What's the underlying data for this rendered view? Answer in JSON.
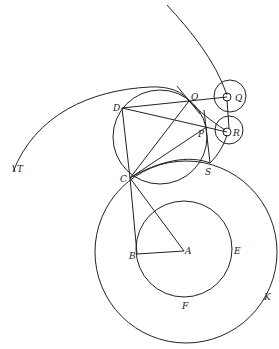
{
  "diagram": {
    "title": "",
    "labels": {
      "T": "T",
      "D": "D",
      "O": "O",
      "Q": "Q",
      "R": "R",
      "P": "P",
      "S": "S",
      "C": "C",
      "B": "B",
      "A": "A",
      "E": "E",
      "F": "F",
      "K": "K"
    },
    "points": {
      "A": [
        184,
        251
      ],
      "B": [
        137,
        254
      ],
      "C": [
        130,
        178
      ],
      "D": [
        122,
        108
      ],
      "O": [
        189,
        101
      ],
      "P": [
        205,
        128
      ],
      "S": [
        210,
        163
      ],
      "Q": [
        227,
        97
      ],
      "R": [
        227,
        132
      ]
    },
    "circles": [
      {
        "name": "outer-circle-K",
        "center": [
          186,
          252
        ],
        "r": 91
      },
      {
        "name": "inner-circle-EF",
        "center": [
          184,
          249
        ],
        "r": 48
      },
      {
        "name": "circle-DOPC",
        "center": [
          160,
          137
        ],
        "r": 47
      },
      {
        "name": "circle-Q-outer",
        "center": [
          230,
          96
        ],
        "r": 16
      },
      {
        "name": "circle-Q-inner",
        "center": [
          227,
          97
        ],
        "r": 4
      },
      {
        "name": "circle-R-outer",
        "center": [
          229,
          130
        ],
        "r": 14
      },
      {
        "name": "circle-R-inner",
        "center": [
          227,
          132
        ],
        "r": 4
      }
    ]
  }
}
